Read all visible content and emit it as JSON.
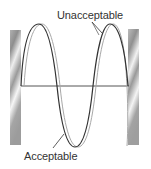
{
  "diagram": {
    "title": "",
    "labels": {
      "unacceptable": "Unacceptable",
      "acceptable": "Acceptable"
    },
    "elements": {
      "left_wall": "fixed-end-support-left",
      "right_wall": "fixed-end-support-right",
      "baseline": "equilibrium-line",
      "acceptable_curve": "standing-wave-acceptable",
      "unacceptable_curve": "standing-wave-unacceptable"
    },
    "colors": {
      "acceptable_curve": "#333333",
      "unacceptable_curve": "#a8a8a8",
      "baseline": "#555555",
      "wall_dark": "#9a9a9a",
      "wall_light": "#f4f4f4",
      "text": "#333333"
    }
  }
}
